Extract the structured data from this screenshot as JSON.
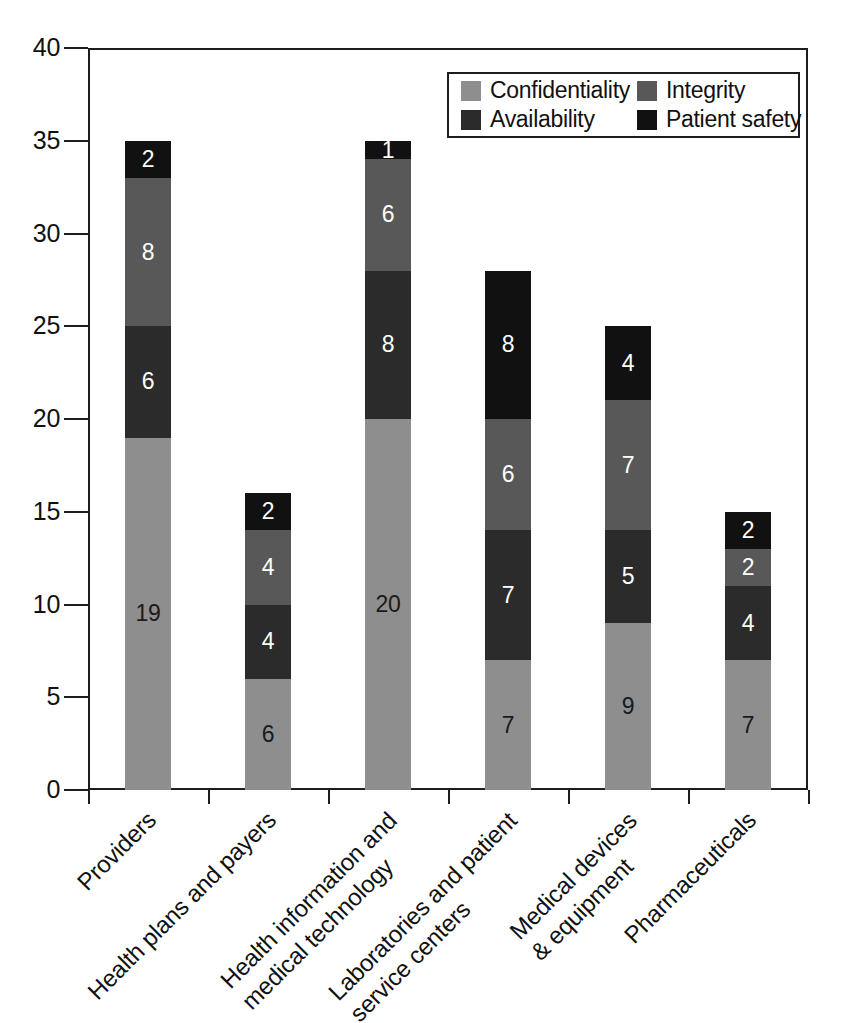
{
  "chart_data": {
    "type": "bar",
    "subtype": "stacked-bar",
    "title": "",
    "subtitle": "",
    "xlabel": "",
    "ylabel": "",
    "ylim": [
      0,
      40
    ],
    "ytick_step": 5,
    "ytick_labels": [
      "40",
      "35",
      "30",
      "25",
      "20",
      "15",
      "10",
      "5",
      "0"
    ],
    "ytick_values": [
      40,
      35,
      30,
      25,
      20,
      15,
      10,
      5,
      0
    ],
    "grid": false,
    "legend_position": "top-right",
    "stack_order_bottom_to_top": [
      "Confidentiality",
      "Availability",
      "Integrity",
      "Patient safety"
    ],
    "categories": [
      "Providers",
      "Health plans and payers",
      "Health information and\nmedical technology",
      "Laboratories and patient\nservice centers",
      "Medical devices\n& equipment",
      "Pharmaceuticals"
    ],
    "series": [
      {
        "name": "Confidentiality",
        "color": "#8e8e8e",
        "values": [
          19,
          6,
          20,
          7,
          9,
          7
        ]
      },
      {
        "name": "Availability",
        "color": "#2b2b2b",
        "values": [
          6,
          4,
          8,
          7,
          5,
          4
        ]
      },
      {
        "name": "Integrity",
        "color": "#585858",
        "values": [
          8,
          4,
          6,
          6,
          7,
          2
        ]
      },
      {
        "name": "Patient safety",
        "color": "#111111",
        "values": [
          2,
          2,
          1,
          8,
          4,
          2
        ]
      }
    ],
    "totals": [
      35,
      16,
      35,
      28,
      25,
      15
    ]
  },
  "legend": {
    "entries": [
      {
        "label": "Confidentiality",
        "color": "#8e8e8e"
      },
      {
        "label": "Integrity",
        "color": "#585858"
      },
      {
        "label": "Availability",
        "color": "#2b2b2b"
      },
      {
        "label": "Patient safety",
        "color": "#111111"
      }
    ]
  },
  "axis": {
    "y_labels": [
      "40",
      "35",
      "30",
      "25",
      "20",
      "15",
      "10",
      "5",
      "0"
    ],
    "x_labels": [
      {
        "lines": [
          "Providers"
        ]
      },
      {
        "lines": [
          "Health plans and payers"
        ]
      },
      {
        "lines": [
          "Health information and",
          "medical technology"
        ]
      },
      {
        "lines": [
          "Laboratories and patient",
          "service centers"
        ]
      },
      {
        "lines": [
          "Medical devices",
          "& equipment"
        ]
      },
      {
        "lines": [
          "Pharmaceuticals"
        ]
      }
    ]
  },
  "bar_labels": {
    "bar0": {
      "conf": "19",
      "avail": "6",
      "integ": "8",
      "safety": "2"
    },
    "bar1": {
      "conf": "6",
      "avail": "4",
      "integ": "4",
      "safety": "2"
    },
    "bar2": {
      "conf": "20",
      "avail": "8",
      "integ": "6",
      "safety": "1"
    },
    "bar3": {
      "conf": "7",
      "avail": "7",
      "integ": "6",
      "safety": "8"
    },
    "bar4": {
      "conf": "9",
      "avail": "5",
      "integ": "7",
      "safety": "4"
    },
    "bar5": {
      "conf": "7",
      "avail": "4",
      "integ": "2",
      "safety": "2"
    }
  }
}
